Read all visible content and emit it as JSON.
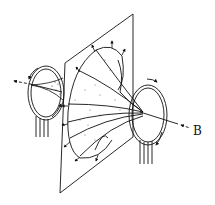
{
  "diagram": {
    "labels": {
      "field": "B"
    },
    "elements": [
      {
        "name": "left-coil",
        "type": "loop",
        "current_arrows": 2
      },
      {
        "name": "right-coil",
        "type": "loop",
        "current_arrows": 2
      },
      {
        "name": "tilted-plane",
        "type": "plane"
      },
      {
        "name": "flux-horn",
        "type": "surface",
        "boundary_arrows": 12
      },
      {
        "name": "axis-line",
        "type": "line"
      }
    ],
    "colors": {
      "ink": "#111111",
      "background": "#ffffff"
    }
  }
}
